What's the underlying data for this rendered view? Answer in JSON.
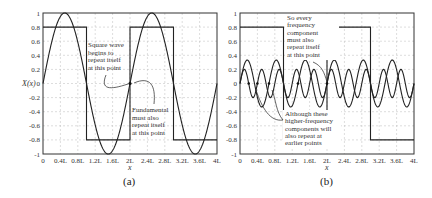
{
  "chart_data": [
    {
      "type": "line",
      "panel": "(a)",
      "xlabel": "x",
      "ylabel": "X(x)",
      "xlim": [
        0,
        4
      ],
      "ylim": [
        -1,
        1
      ],
      "x_unit": "L",
      "x_ticks": [
        "0",
        "0.4L",
        "0.8L",
        "1.2L",
        "1.6L",
        "2L",
        "2.4L",
        "2.8L",
        "3.2L",
        "3.6L",
        "4L"
      ],
      "y_ticks": [
        "1",
        "0.8",
        "0.6",
        "0.4",
        "0.2",
        "0",
        "-0.2",
        "-0.4",
        "-0.6",
        "-0.8",
        "-1"
      ],
      "grid": true,
      "series": [
        {
          "name": "Square wave",
          "kind": "square",
          "amplitude": 0.8,
          "period_L": 2,
          "segments": [
            [
              0,
              1,
              0.8
            ],
            [
              1,
              2,
              -0.8
            ],
            [
              2,
              3,
              0.8
            ],
            [
              3,
              4,
              -0.8
            ]
          ]
        },
        {
          "name": "Fundamental",
          "kind": "sine",
          "amplitude": 1.0,
          "period_L": 2
        }
      ],
      "annotations": [
        {
          "text": [
            "Square wave",
            "begins to",
            "repeat itself",
            "at this point"
          ],
          "points_to": [
            2,
            0
          ]
        },
        {
          "text": [
            "Fundamental",
            "must also",
            "repeat itself",
            "at this point"
          ],
          "points_to": [
            2,
            0
          ]
        }
      ],
      "caption": "(a)"
    },
    {
      "type": "line",
      "panel": "(b)",
      "xlabel": "x",
      "xlim": [
        0,
        4
      ],
      "ylim": [
        -1,
        1
      ],
      "x_unit": "L",
      "x_ticks": [
        "0",
        "0.4L",
        "0.8L",
        "1.2L",
        "1.6L",
        "2L",
        "2.4L",
        "2.8L",
        "3.2L",
        "3.6L",
        "4L"
      ],
      "y_ticks": [
        "1",
        "0.8",
        "0.6",
        "0.4",
        "0.2",
        "0",
        "-0.2",
        "-0.4",
        "-0.6",
        "-0.8",
        "-1"
      ],
      "grid": true,
      "series": [
        {
          "name": "Square wave",
          "kind": "square",
          "amplitude": 0.8,
          "period_L": 2
        },
        {
          "name": "3rd harmonic",
          "kind": "sine",
          "amplitude": 0.333,
          "period_L": 0.6667
        },
        {
          "name": "5th harmonic",
          "kind": "sine",
          "amplitude": 0.2,
          "period_L": 0.4
        }
      ],
      "annotations": [
        {
          "text": [
            "So every",
            "frequency",
            "component",
            "must also",
            "repeat itself",
            "at this point"
          ],
          "points_to": [
            2,
            0
          ]
        },
        {
          "text": [
            "Although these",
            "higher-frequency",
            "components will",
            "also repeat at",
            "earlier points"
          ],
          "points_to": [
            0.4,
            0
          ]
        }
      ],
      "caption": "(b)"
    }
  ],
  "labels": {
    "ylabel_a": "X(x)",
    "xlabel": "x",
    "caption_a": "(a)",
    "caption_b": "(b)"
  }
}
